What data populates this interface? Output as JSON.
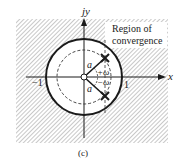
{
  "figure": {
    "caption": "(c)",
    "axes": {
      "x_label": "x",
      "y_label": "jy",
      "tick_neg_one": "−1",
      "tick_pos_one": "1"
    },
    "region_label_line1": "Region of",
    "region_label_line2": "convergence",
    "pole_magnitude_label_upper": "a",
    "pole_magnitude_label_lower": "a",
    "angle_label_pos": "+ω",
    "angle_label_neg": "−ω",
    "elements": {
      "unit_circle": "solid, radius 1",
      "pole_radius_circle": "dashed, radius a",
      "poles": "two crosses at a·e^{±jω}",
      "zero": "open circle at origin",
      "shaded_region": "outside unit circle (|z| > 1) hatched"
    },
    "colors": {
      "ink": "#1a1a1a",
      "hatch": "#9a9a9a",
      "background": "#ffffff"
    }
  }
}
